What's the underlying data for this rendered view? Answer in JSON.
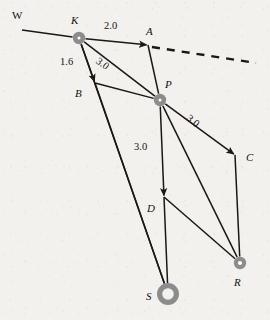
{
  "figure": {
    "kind": "directed-graph-diagram",
    "background_color": "#f2f1ee",
    "line_color": "#1a1714",
    "node_color": "#8c8c8c",
    "node_core_color": "#ffffff"
  },
  "nodes": [
    {
      "id": "W",
      "label": "W",
      "x": 22,
      "y": 30,
      "label_x": 12,
      "label_y": 10,
      "style": "none",
      "italic": false
    },
    {
      "id": "K",
      "label": "K",
      "x": 79,
      "y": 38,
      "label_x": 71,
      "label_y": 15,
      "style": "disc",
      "italic": true
    },
    {
      "id": "A",
      "label": "A",
      "x": 148,
      "y": 45,
      "label_x": 146,
      "label_y": 26,
      "style": "none",
      "italic": true
    },
    {
      "id": "B",
      "label": "B",
      "x": 95,
      "y": 83,
      "label_x": 75,
      "label_y": 88,
      "style": "none",
      "italic": true
    },
    {
      "id": "P",
      "label": "P",
      "x": 160,
      "y": 100,
      "label_x": 165,
      "label_y": 79,
      "style": "disc",
      "italic": true
    },
    {
      "id": "C",
      "label": "C",
      "x": 235,
      "y": 155,
      "label_x": 246,
      "label_y": 152,
      "style": "none",
      "italic": true
    },
    {
      "id": "D",
      "label": "D",
      "x": 164,
      "y": 197,
      "label_x": 147,
      "label_y": 203,
      "style": "none",
      "italic": true
    },
    {
      "id": "R",
      "label": "R",
      "x": 240,
      "y": 263,
      "label_x": 234,
      "label_y": 277,
      "style": "ring-small",
      "italic": true
    },
    {
      "id": "S",
      "label": "S",
      "x": 168,
      "y": 294,
      "label_x": 146,
      "label_y": 291,
      "style": "ring-large",
      "italic": true
    }
  ],
  "edges": [
    {
      "from": "W",
      "to": "K",
      "arrow": false,
      "dashed": false
    },
    {
      "from": "K",
      "to": "A",
      "arrow": true,
      "dashed": false
    },
    {
      "from": "K",
      "to": "B",
      "arrow": true,
      "dashed": false
    },
    {
      "from": "K",
      "to": "P",
      "arrow": false,
      "dashed": false
    },
    {
      "from": "K",
      "to": "S",
      "arrow": false,
      "dashed": false
    },
    {
      "from": "A",
      "to": "P",
      "arrow": false,
      "dashed": false
    },
    {
      "from": "B",
      "to": "P",
      "arrow": false,
      "dashed": false
    },
    {
      "from": "B",
      "to": "S",
      "arrow": false,
      "dashed": false
    },
    {
      "from": "P",
      "to": "C",
      "arrow": true,
      "dashed": false
    },
    {
      "from": "P",
      "to": "D",
      "arrow": true,
      "dashed": false
    },
    {
      "from": "P",
      "to": "R",
      "arrow": false,
      "dashed": false
    },
    {
      "from": "C",
      "to": "R",
      "arrow": false,
      "dashed": false
    },
    {
      "from": "D",
      "to": "S",
      "arrow": false,
      "dashed": false
    },
    {
      "from": "D",
      "to": "R",
      "arrow": false,
      "dashed": false
    },
    {
      "from": "A",
      "to": "ray-end",
      "arrow": false,
      "dashed": true
    }
  ],
  "ray": {
    "x1": 152,
    "y1": 47,
    "x2": 256,
    "y2": 63
  },
  "edge_labels": [
    {
      "id": "ka",
      "text": "2.0",
      "x": 104,
      "y": 21,
      "rotate": 0,
      "for_edge": "K-A"
    },
    {
      "id": "kb",
      "text": "1.6",
      "x": 60,
      "y": 57,
      "rotate": 0,
      "for_edge": "K-B"
    },
    {
      "id": "kp",
      "text": "3.0",
      "x": 100,
      "y": 56,
      "rotate": 36,
      "for_edge": "K-P"
    },
    {
      "id": "pc",
      "text": "3.0",
      "x": 191,
      "y": 113,
      "rotate": 40,
      "for_edge": "P-C"
    },
    {
      "id": "pd",
      "text": "3.0",
      "x": 134,
      "y": 142,
      "rotate": 0,
      "for_edge": "P-D"
    }
  ]
}
